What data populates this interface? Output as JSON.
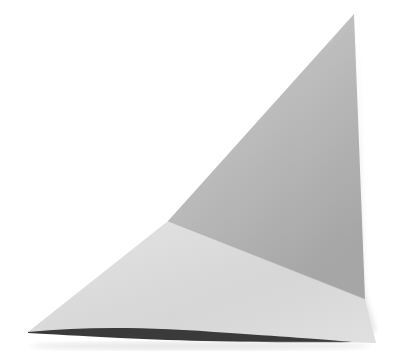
{
  "image": {
    "subject": "folded paper triangle",
    "description": "A sheet of white paper folded into an irregular triangular shape on a white background, with a darker grey upper flap and a lighter lower flap, casting a thin dark shadow along the bottom edge.",
    "colors": {
      "background": "#ffffff",
      "upper_flap_light": "#dcdcdc",
      "upper_flap_dark": "#a9a9a9",
      "lower_flap": "#d9d9d9",
      "lower_flap_light": "#ebebeb",
      "shadow": "#3a3a3a"
    }
  }
}
